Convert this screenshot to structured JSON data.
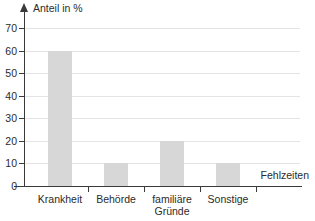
{
  "chart_data": {
    "type": "bar",
    "title": "",
    "subtitle": "",
    "xlabel": "Fehlzeiten",
    "ylabel": "Anteil in %",
    "categories": [
      "Krankheit",
      "Behörde",
      "familiäre Gründe",
      "Sonstige"
    ],
    "category_lines": [
      [
        "Krankheit"
      ],
      [
        "Behörde"
      ],
      [
        "familiäre",
        "Gründe"
      ],
      [
        "Sonstige"
      ]
    ],
    "values": [
      60,
      10,
      20,
      10
    ],
    "ylim": [
      0,
      70
    ],
    "ytick_step": 10,
    "yticks": [
      0,
      10,
      20,
      30,
      40,
      50,
      60,
      70
    ],
    "ytick_labels": [
      "0",
      "10",
      "20",
      "30",
      "40",
      "50",
      "60",
      "70"
    ],
    "grid": true,
    "grid_axis": "y",
    "legend": false,
    "legend_position": "none",
    "bar_color": "#d7d7d7",
    "axis_color": "#3a3a3a",
    "grid_color": "#e4e4e4",
    "text_color": "#2b2b2b"
  },
  "axis": {
    "y_title": "Anteil in %",
    "x_title": "Fehlzeiten"
  }
}
